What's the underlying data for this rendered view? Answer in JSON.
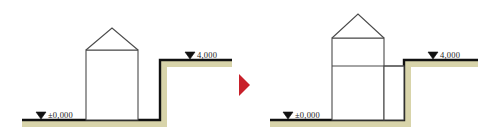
{
  "figure": {
    "type": "architectural-section-diagram",
    "background_color": "#ffffff",
    "line_color": "#1b1b1b",
    "terrain_fill_color": "#d8d4aa",
    "terrain_edge_color": "#111111",
    "building_outline_color": "#4a4a4a",
    "arrow_color": "#c8202a"
  },
  "separator": {
    "icon": "right-arrow-icon",
    "label": "",
    "color": "#c8202a"
  },
  "scenes": [
    {
      "id": "before",
      "name": "existing-section",
      "levels": [
        {
          "id": "ground",
          "marker": "level-triangle",
          "label": "±0,000",
          "value": 0.0
        },
        {
          "id": "upper-terrain",
          "marker": "level-triangle",
          "label": "4,000",
          "value": 4.0
        }
      ],
      "elements": [
        {
          "name": "house-body",
          "kind": "rectangle"
        },
        {
          "name": "gable-roof",
          "kind": "triangle"
        },
        {
          "name": "eave-line",
          "kind": "line"
        },
        {
          "name": "terrain-lower",
          "kind": "ground"
        },
        {
          "name": "terrain-upper",
          "kind": "ground"
        },
        {
          "name": "retaining-wall",
          "kind": "line"
        }
      ]
    },
    {
      "id": "after",
      "name": "extended-section",
      "levels": [
        {
          "id": "ground",
          "marker": "level-triangle",
          "label": "±0,000",
          "value": 0.0
        },
        {
          "id": "upper-terrain",
          "marker": "level-triangle",
          "label": "4,000",
          "value": 4.0
        }
      ],
      "elements": [
        {
          "name": "house-body",
          "kind": "rectangle"
        },
        {
          "name": "gable-roof",
          "kind": "triangle"
        },
        {
          "name": "eave-line",
          "kind": "line"
        },
        {
          "name": "floor-slab-line",
          "kind": "line"
        },
        {
          "name": "extension-wing",
          "kind": "rectangle"
        },
        {
          "name": "terrain-lower",
          "kind": "ground"
        },
        {
          "name": "terrain-upper",
          "kind": "ground"
        },
        {
          "name": "retaining-wall",
          "kind": "line"
        }
      ]
    }
  ],
  "labels": {
    "left_ground": "±0,000",
    "left_upper": "4,000",
    "right_ground": "±0,000",
    "right_upper": "4,000"
  }
}
